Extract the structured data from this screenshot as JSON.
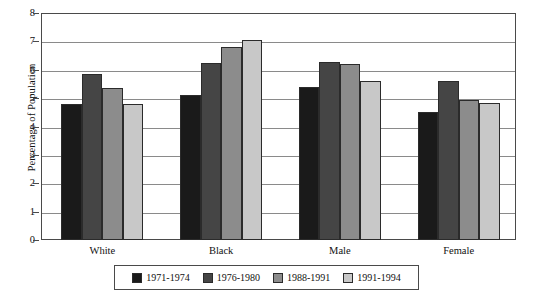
{
  "chart_data": {
    "type": "bar",
    "title": "",
    "xlabel": "",
    "ylabel": "Percentage of Population",
    "ylim": [
      0,
      8
    ],
    "yticks": [
      "0",
      "1",
      "2",
      "3",
      "4",
      "5",
      "6",
      "7",
      "8"
    ],
    "grid": true,
    "legend_position": "bottom",
    "categories": [
      "White",
      "Black",
      "Male",
      "Female"
    ],
    "series": [
      {
        "name": "1971-1974",
        "color": "#1a1a1a",
        "values": [
          4.8,
          5.1,
          5.4,
          4.5
        ]
      },
      {
        "name": "1976-1980",
        "color": "#454545",
        "values": [
          5.85,
          6.25,
          6.28,
          5.6
        ]
      },
      {
        "name": "1988-1991",
        "color": "#8c8c8c",
        "values": [
          5.35,
          6.8,
          6.22,
          4.95
        ]
      },
      {
        "name": "1991-1994",
        "color": "#c8c8c8",
        "values": [
          4.78,
          7.05,
          5.62,
          4.82
        ]
      }
    ]
  }
}
